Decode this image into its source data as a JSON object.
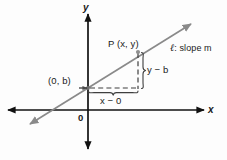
{
  "figure": {
    "kind": "coordinate-geometry-diagram",
    "colors": {
      "axis": "#111111",
      "line": "#7d7d7d",
      "dashed": "#4a4a4a",
      "brace": "#4a4a4a",
      "text": "#1a1a1a",
      "background": "#fdfdfd"
    },
    "axes": {
      "y_axis_label": "y",
      "x_axis_label": "x",
      "origin_label": "0"
    },
    "labels": {
      "point_p": "P (x, y)",
      "intercept": "(0, b)",
      "rise": "y − b",
      "run": "x − 0",
      "line_name": "ℓ",
      "line_caption": ": slope m",
      "line_caption_full": "ℓ : slope m"
    },
    "geometry": {
      "origin": {
        "x": 88,
        "y": 110
      },
      "point_p": {
        "x": 138,
        "y": 52
      },
      "intercept_point": {
        "x": 88,
        "y": 88
      },
      "x_axis": {
        "x1": 6,
        "x2": 206,
        "y": 110
      },
      "y_axis": {
        "x": 88,
        "y1": 12,
        "y2": 151
      },
      "line_l": {
        "x1": 28,
        "y1": 126,
        "x2": 193,
        "y2": 22
      }
    }
  }
}
